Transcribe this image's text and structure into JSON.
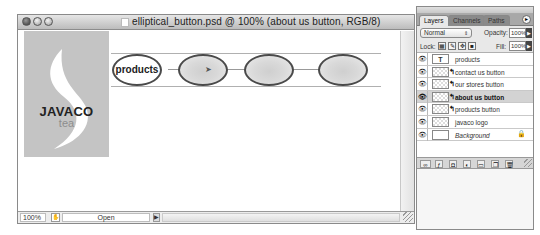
{
  "window": {
    "title": "elliptical_button.psd @ 100% (about us button, RGB/8)",
    "traffic_lights": [
      "close",
      "minimize",
      "zoom"
    ]
  },
  "canvas": {
    "logo": {
      "brand": "JAVACO",
      "sub": "tea",
      "bg_color": "#c4c4c4"
    },
    "buttons": [
      {
        "label": "products",
        "style": "outlined"
      },
      {
        "label": "",
        "style": "gradient"
      },
      {
        "label": "",
        "style": "gradient"
      },
      {
        "label": "",
        "style": "gradient"
      }
    ],
    "cursor_icon": "pointer"
  },
  "statusbar": {
    "zoom": "100%",
    "doc_info": "Open",
    "arrow": "▶"
  },
  "layers_panel": {
    "tabs": [
      {
        "label": "Layers",
        "active": true
      },
      {
        "label": "Channels",
        "active": false
      },
      {
        "label": "Paths",
        "active": false
      }
    ],
    "blend_mode": "Normal",
    "opacity_label": "Opacity:",
    "opacity": "100%",
    "lock_label": "Lock:",
    "fill_label": "Fill:",
    "fill": "100%",
    "layers": [
      {
        "name": "products",
        "type": "text",
        "selected": false
      },
      {
        "name": "contact us button",
        "type": "shape",
        "selected": false
      },
      {
        "name": "our stores button",
        "type": "shape",
        "selected": false
      },
      {
        "name": "about us button",
        "type": "shape",
        "selected": true
      },
      {
        "name": "products button",
        "type": "shape",
        "selected": false
      },
      {
        "name": "javaco logo",
        "type": "pixel",
        "selected": false
      },
      {
        "name": "Background",
        "type": "background",
        "selected": false,
        "locked": true
      }
    ],
    "bottom_icons": [
      "link-layers",
      "layer-style",
      "layer-mask",
      "adjustment-layer",
      "new-group",
      "new-layer",
      "delete-layer"
    ]
  }
}
